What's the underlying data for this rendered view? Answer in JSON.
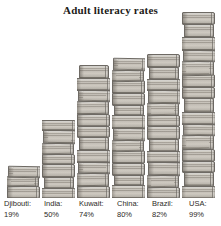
{
  "chart_data": {
    "type": "bar",
    "title": "Adult literacy rates",
    "xlabel": "",
    "ylabel": "",
    "ylim": [
      0,
      100
    ],
    "grid": false,
    "legend": null,
    "units": "%",
    "style": "pictorial bar chart; each bar is a drawn stack of books",
    "categories": [
      "Djibouti",
      "India",
      "Kuwait",
      "China",
      "Brazil",
      "USA"
    ],
    "values": [
      19,
      50,
      74,
      80,
      82,
      99
    ],
    "value_labels": [
      "19%",
      "50%",
      "74%",
      "80%",
      "82%",
      "99%"
    ],
    "note": "USA bar is clipped by the top edge of the image"
  },
  "chart": {
    "title": "Adult literacy rates",
    "background_color": "#ffffff",
    "ink_color": "#2b2926",
    "book_color": "#bdb8af",
    "book_outline_color": "#6e6a64"
  },
  "bars": [
    {
      "name": "Djibouti",
      "value_label": "19%",
      "books": 3
    },
    {
      "name": "India",
      "value_label": "50%",
      "books": 7
    },
    {
      "name": "Kuwait",
      "value_label": "74%",
      "books": 11
    },
    {
      "name": "China",
      "value_label": "80%",
      "books": 12
    },
    {
      "name": "Brazil",
      "value_label": "82%",
      "books": 12
    },
    {
      "name": "USA",
      "value_label": "99%",
      "books": 15
    }
  ]
}
